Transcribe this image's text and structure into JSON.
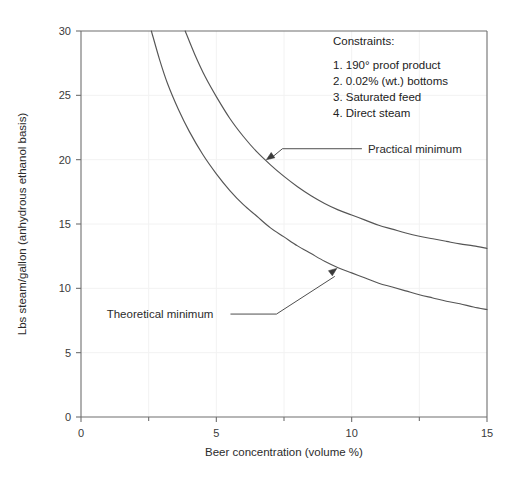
{
  "chart_data": {
    "type": "line",
    "title": "",
    "xlabel": "Beer concentration (volume %)",
    "ylabel": "Lbs steam/gallon (anhydrous ethanol basis)",
    "xlim": [
      0,
      15
    ],
    "ylim": [
      0,
      30
    ],
    "xticks": [
      0,
      5,
      10,
      15
    ],
    "yticks": [
      0,
      5,
      10,
      15,
      20,
      25,
      30
    ],
    "xtick_labels": [
      "0",
      "5",
      "10",
      "15"
    ],
    "ytick_labels": [
      "0",
      "5",
      "10",
      "15",
      "20",
      "25",
      "30"
    ],
    "grid": true,
    "legend_position": "none",
    "series": [
      {
        "name": "Practical minimum",
        "x": [
          3.85,
          4.2,
          4.6,
          5.0,
          5.5,
          6.0,
          6.5,
          7.0,
          7.5,
          8.0,
          8.5,
          9.0,
          9.5,
          10.0,
          10.5,
          11.0,
          11.5,
          12.0,
          12.5,
          13.0,
          13.5,
          14.0,
          14.5,
          15.0
        ],
        "y": [
          30.0,
          28.2,
          26.4,
          24.9,
          23.2,
          21.8,
          20.6,
          19.6,
          18.7,
          17.9,
          17.2,
          16.6,
          16.1,
          15.7,
          15.3,
          14.9,
          14.6,
          14.3,
          14.05,
          13.85,
          13.65,
          13.45,
          13.3,
          13.1
        ]
      },
      {
        "name": "Theoretical minimum",
        "x": [
          2.6,
          2.9,
          3.2,
          3.6,
          4.0,
          4.5,
          5.0,
          5.5,
          6.0,
          6.5,
          7.0,
          7.5,
          8.0,
          8.5,
          9.0,
          9.5,
          10.0,
          10.5,
          11.0,
          11.5,
          12.0,
          12.5,
          13.0,
          13.5,
          14.0,
          14.5,
          15.0
        ],
        "y": [
          30.0,
          27.8,
          25.9,
          23.9,
          22.2,
          20.4,
          18.9,
          17.6,
          16.5,
          15.6,
          14.7,
          14.0,
          13.3,
          12.7,
          12.1,
          11.6,
          11.2,
          10.8,
          10.4,
          10.1,
          9.8,
          9.5,
          9.25,
          9.0,
          8.8,
          8.55,
          8.35
        ]
      }
    ],
    "annotations": [
      {
        "label": "Practical minimum",
        "text_x": 10.6,
        "text_y": 20.85,
        "point_x": 6.85,
        "point_y": 20.0
      },
      {
        "label": "Theoretical minimum",
        "text_x": 0.95,
        "text_y": 8.0,
        "point_x": 9.45,
        "point_y": 11.55
      }
    ],
    "constraints_box": {
      "heading": "Constraints:",
      "items": [
        "1.  190° proof product",
        "2.  0.02% (wt.) bottoms",
        "3.  Saturated feed",
        "4.  Direct steam"
      ]
    }
  },
  "colors": {
    "curve": "#555555",
    "axis": "#6f6f6f",
    "grid": "#f2f2f2",
    "text": "#2b2b2b",
    "background": "#ffffff"
  }
}
